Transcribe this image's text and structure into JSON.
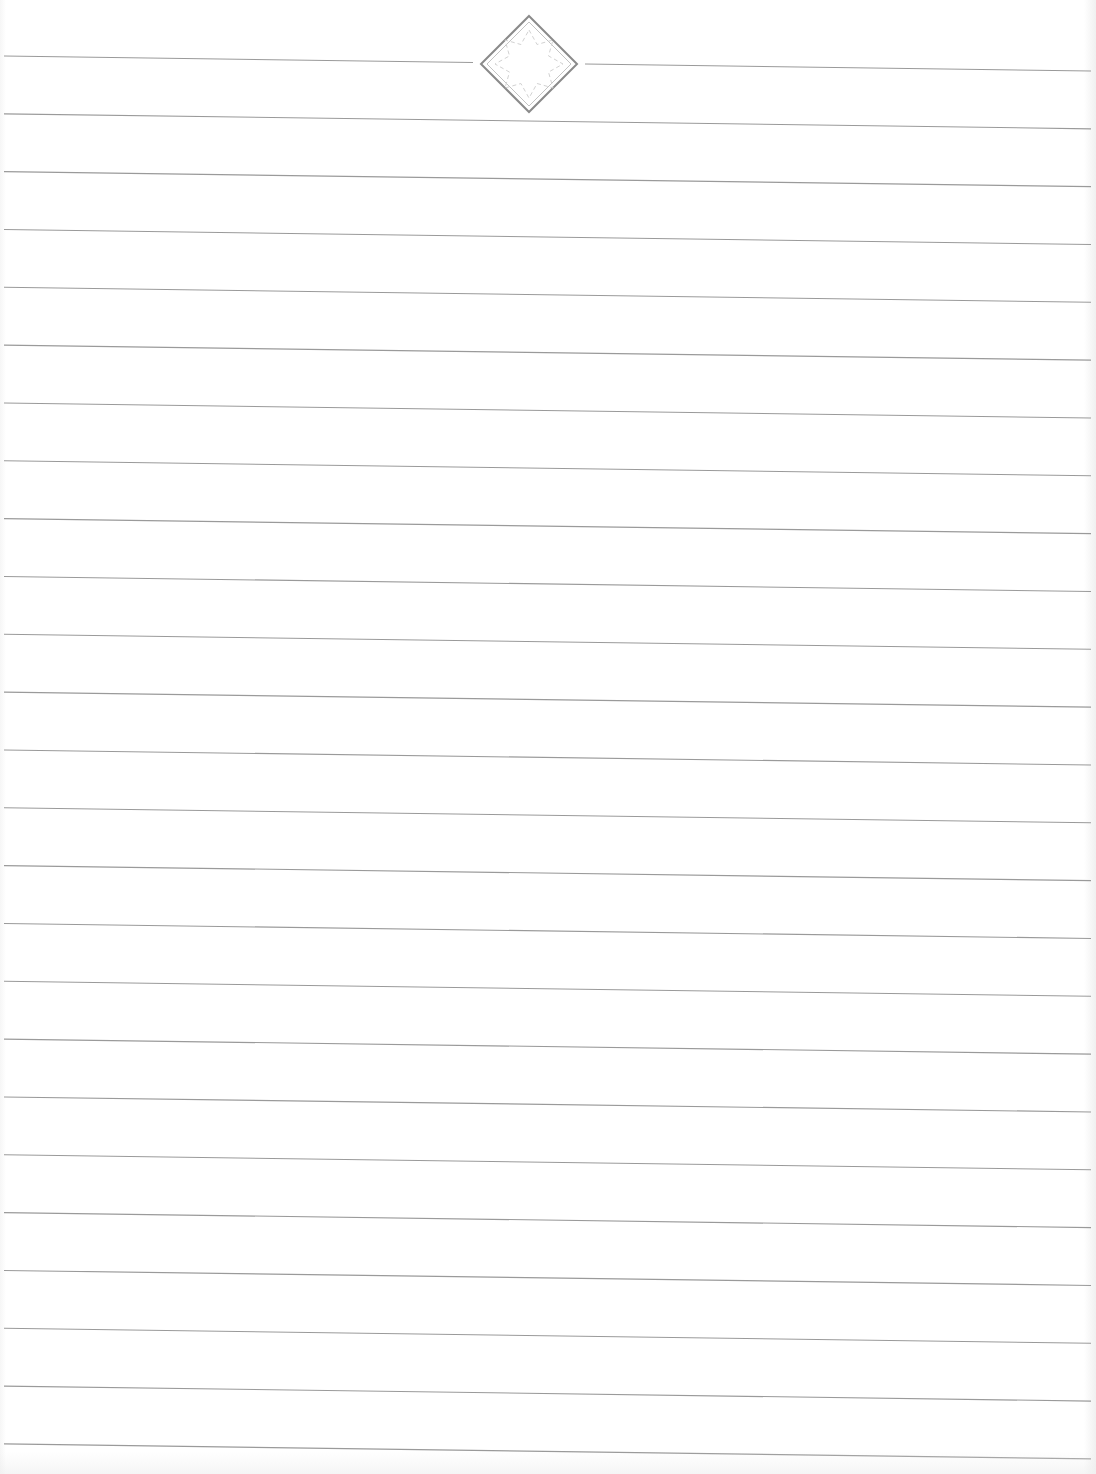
{
  "page": {
    "type": "lined-notebook-paper",
    "width": 1096,
    "height": 1474,
    "background_color": "#ffffff",
    "line_color": "#9a9a9a",
    "line_count": 25,
    "first_line_left_y": 56,
    "first_line_right_y": 71,
    "line_spacing": 57.83,
    "line_start_x": 4,
    "line_end_x": 1091
  },
  "ornament": {
    "icon": "diamond-star-ornament-icon",
    "center_x": 529,
    "center_y": 64,
    "half_size": 48,
    "outer_color": "#8a8a8a",
    "inner_color": "#c4c4c4",
    "star_color": "#d2d2d2",
    "gap_left_x": 473,
    "gap_right_x": 585
  }
}
